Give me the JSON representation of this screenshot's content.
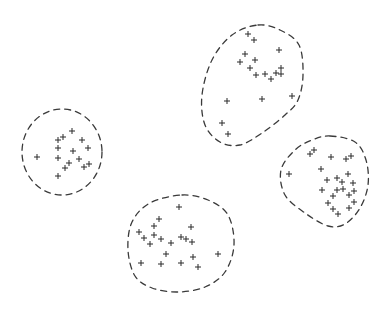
{
  "diagram": {
    "colors": {
      "background": "#ffffff",
      "stroke": "#3a3a3a",
      "point": "#2b2b2b"
    },
    "marker": "plus",
    "clusters": [
      {
        "id": "left",
        "boundary": {
          "shape": "ellipse",
          "center": [
            62,
            152
          ],
          "radius": [
            40,
            43
          ]
        },
        "points": [
          [
            72,
            131
          ],
          [
            63,
            137
          ],
          [
            58,
            140
          ],
          [
            82,
            140
          ],
          [
            58,
            148
          ],
          [
            73,
            151
          ],
          [
            88,
            148
          ],
          [
            37,
            157
          ],
          [
            58,
            158
          ],
          [
            79,
            159
          ],
          [
            69,
            163
          ],
          [
            89,
            164
          ],
          [
            65,
            168
          ],
          [
            84,
            167
          ],
          [
            58,
            176
          ]
        ]
      },
      {
        "id": "top-right",
        "boundary": {
          "shape": "path",
          "outline": [
            [
              258,
              25
            ],
            [
              280,
              30
            ],
            [
              299,
              45
            ],
            [
              303,
              75
            ],
            [
              298,
              100
            ],
            [
              285,
              115
            ],
            [
              262,
              133
            ],
            [
              240,
              145
            ],
            [
              220,
              142
            ],
            [
              205,
              125
            ],
            [
              202,
              95
            ],
            [
              212,
              60
            ],
            [
              232,
              35
            ]
          ]
        },
        "points": [
          [
            248,
            34
          ],
          [
            254,
            40
          ],
          [
            279,
            50
          ],
          [
            245,
            54
          ],
          [
            255,
            60
          ],
          [
            240,
            62
          ],
          [
            250,
            68
          ],
          [
            281,
            68
          ],
          [
            256,
            75
          ],
          [
            265,
            74
          ],
          [
            276,
            73
          ],
          [
            281,
            74
          ],
          [
            271,
            79
          ],
          [
            227,
            101
          ],
          [
            262,
            99
          ],
          [
            292,
            96
          ],
          [
            222,
            123
          ],
          [
            228,
            134
          ]
        ]
      },
      {
        "id": "right",
        "boundary": {
          "shape": "path",
          "outline": [
            [
              330,
              136
            ],
            [
              355,
              142
            ],
            [
              366,
              160
            ],
            [
              368,
              185
            ],
            [
              360,
              208
            ],
            [
              345,
              224
            ],
            [
              328,
              226
            ],
            [
              305,
              213
            ],
            [
              285,
              195
            ],
            [
              281,
              170
            ],
            [
              295,
              150
            ],
            [
              312,
              140
            ]
          ]
        },
        "points": [
          [
            310,
            154
          ],
          [
            314,
            150
          ],
          [
            331,
            157
          ],
          [
            346,
            159
          ],
          [
            351,
            156
          ],
          [
            289,
            174
          ],
          [
            321,
            169
          ],
          [
            348,
            174
          ],
          [
            327,
            180
          ],
          [
            337,
            178
          ],
          [
            342,
            182
          ],
          [
            353,
            183
          ],
          [
            322,
            190
          ],
          [
            337,
            190
          ],
          [
            343,
            189
          ],
          [
            354,
            191
          ],
          [
            333,
            196
          ],
          [
            349,
            195
          ],
          [
            328,
            203
          ],
          [
            354,
            202
          ],
          [
            333,
            209
          ],
          [
            349,
            208
          ],
          [
            338,
            214
          ]
        ]
      },
      {
        "id": "bottom",
        "boundary": {
          "shape": "path",
          "outline": [
            [
              182,
              195
            ],
            [
              208,
              200
            ],
            [
              228,
              215
            ],
            [
              234,
              245
            ],
            [
              225,
              272
            ],
            [
              205,
              287
            ],
            [
              178,
              292
            ],
            [
              152,
              288
            ],
            [
              135,
              276
            ],
            [
              128,
              250
            ],
            [
              132,
              222
            ],
            [
              150,
              203
            ]
          ]
        },
        "points": [
          [
            179,
            207
          ],
          [
            159,
            219
          ],
          [
            154,
            226
          ],
          [
            191,
            227
          ],
          [
            139,
            232
          ],
          [
            154,
            235
          ],
          [
            144,
            238
          ],
          [
            161,
            239
          ],
          [
            181,
            237
          ],
          [
            186,
            239
          ],
          [
            192,
            242
          ],
          [
            150,
            244
          ],
          [
            171,
            243
          ],
          [
            166,
            254
          ],
          [
            193,
            257
          ],
          [
            218,
            254
          ],
          [
            141,
            263
          ],
          [
            161,
            264
          ],
          [
            181,
            263
          ],
          [
            198,
            267
          ]
        ]
      }
    ]
  }
}
